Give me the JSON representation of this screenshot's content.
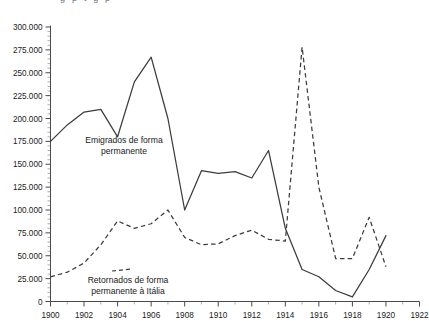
{
  "chart_data": {
    "type": "line",
    "title": "",
    "xlabel": "",
    "ylabel": "",
    "xlim": [
      1900,
      1922
    ],
    "ylim": [
      0,
      300000
    ],
    "y_ticks": [
      0,
      25000,
      50000,
      75000,
      100000,
      125000,
      150000,
      175000,
      200000,
      225000,
      250000,
      275000,
      300000
    ],
    "y_tick_labels": [
      "0",
      "25.000",
      "50.000",
      "75.000",
      "100.000",
      "125.000",
      "150.000",
      "175.000",
      "200.000",
      "225.000",
      "250.000",
      "275.000",
      "300.000"
    ],
    "x_ticks": [
      1900,
      1902,
      1904,
      1906,
      1908,
      1910,
      1912,
      1914,
      1916,
      1918,
      1920,
      1922
    ],
    "x_tick_labels": [
      "1900",
      "1902",
      "1904",
      "1906",
      "1908",
      "1910",
      "1912",
      "1914",
      "1916",
      "1918",
      "1920",
      "1922"
    ],
    "x_minor_step": 1,
    "y_minor_step": 5000,
    "grid": false,
    "legend_position": "inline-annotation",
    "series": [
      {
        "name": "Emigrados de forma permanente",
        "style": "solid",
        "color": "#3c3c3c",
        "x": [
          1900,
          1901,
          1902,
          1903,
          1904,
          1905,
          1906,
          1907,
          1908,
          1909,
          1910,
          1911,
          1912,
          1913,
          1914,
          1915,
          1916,
          1917,
          1918,
          1919,
          1920
        ],
        "values": [
          175000,
          193000,
          207000,
          210000,
          180000,
          240000,
          267000,
          200000,
          100000,
          143000,
          140000,
          142000,
          135000,
          165000,
          80000,
          35000,
          27000,
          12000,
          5000,
          35000,
          72000
        ]
      },
      {
        "name": "Retornados de forma permanente à Itália",
        "style": "dashed",
        "color": "#3c3c3c",
        "x": [
          1900,
          1901,
          1902,
          1903,
          1904,
          1905,
          1906,
          1907,
          1908,
          1909,
          1910,
          1911,
          1912,
          1913,
          1914,
          1915,
          1916,
          1917,
          1918,
          1919,
          1920
        ],
        "values": [
          27000,
          32000,
          42000,
          62000,
          88000,
          80000,
          85000,
          100000,
          70000,
          62000,
          63000,
          72000,
          78000,
          68000,
          66000,
          278000,
          125000,
          47000,
          47000,
          92000,
          38000
        ]
      }
    ],
    "annotations": [
      {
        "name": "emigrados-label",
        "lines": [
          "Emigrados de forma",
          "permanente"
        ],
        "x_px": 124,
        "y_px": 143
      },
      {
        "name": "retornados-label",
        "lines": [
          "Retornados de forma",
          "permanente à Itália"
        ],
        "x_px": 128,
        "y_px": 283
      }
    ],
    "top_cropped_text": "g  p    t                                    g           p"
  }
}
